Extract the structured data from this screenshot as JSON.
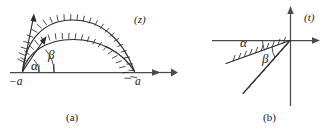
{
  "figure": {
    "kind": "mathematical-diagram",
    "ink_color": "#2b2b2b",
    "axis_color": "#4a4a4a",
    "background_color": "#ffffff"
  },
  "panel_a": {
    "caption": "(a)",
    "plane_label": "(z)",
    "axis_left_label": "−a",
    "axis_right_label": "a",
    "angle_inner_label": "α",
    "angle_outer_label": "β",
    "curves": [
      {
        "name": "outer-arc",
        "from": "−a",
        "to": "a",
        "hatched": true
      },
      {
        "name": "inner-arc",
        "from": "−a",
        "to": "a",
        "hatched": true
      }
    ],
    "tangent_arrows": [
      {
        "name": "outer-tangent-arrow",
        "angle_deg": 72
      },
      {
        "name": "inner-tangent-arrow",
        "angle_deg": 46
      }
    ]
  },
  "panel_b": {
    "caption": "(b)",
    "plane_label": "(t)",
    "angle_inner_label": "α",
    "angle_outer_label": "β",
    "rays": [
      {
        "name": "shallow-ray",
        "angle_deg": 20,
        "hatched": true
      },
      {
        "name": "steep-ray",
        "angle_deg": 45,
        "hatched": true
      }
    ],
    "axes": [
      {
        "name": "horizontal-axis",
        "orientation": "horizontal"
      },
      {
        "name": "vertical-axis",
        "orientation": "vertical"
      }
    ]
  }
}
